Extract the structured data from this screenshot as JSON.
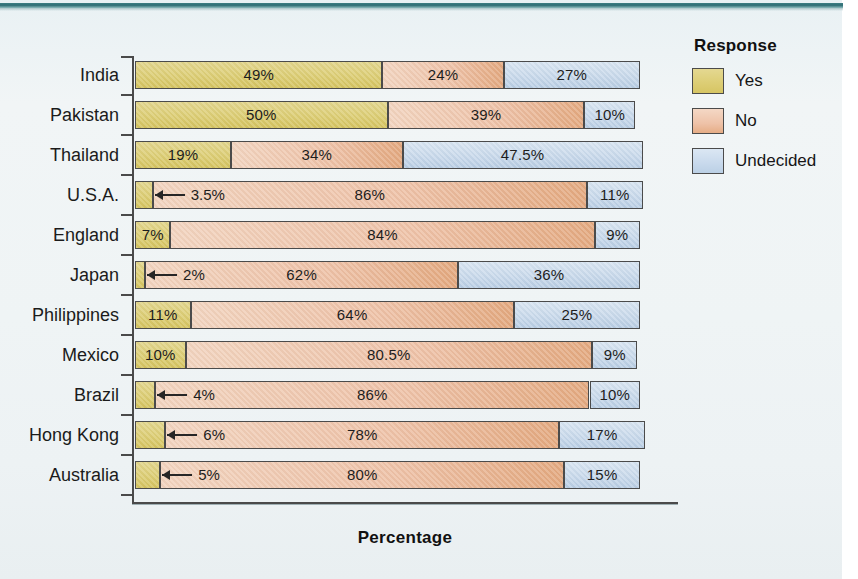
{
  "legend": {
    "title": "Response",
    "entries": [
      {
        "label": "Yes",
        "color": "#ddce76",
        "key": "yes"
      },
      {
        "label": "No",
        "color": "#eec2a8",
        "key": "no"
      },
      {
        "label": "Undecided",
        "color": "#c8d9ec",
        "key": "undecided"
      }
    ]
  },
  "axis": {
    "x_title": "Percentage"
  },
  "chart_data": {
    "type": "bar",
    "orientation": "horizontal",
    "stacked": true,
    "title": "",
    "xlabel": "Percentage",
    "ylabel": "",
    "xlim": [
      0,
      100
    ],
    "grid": false,
    "legend_title": "Response",
    "legend_position": "right",
    "colors": {
      "Yes": "#ddce76",
      "No": "#eec2a8",
      "Undecided": "#c8d9ec"
    },
    "categories": [
      "India",
      "Pakistan",
      "Thailand",
      "U.S.A.",
      "England",
      "Japan",
      "Philippines",
      "Mexico",
      "Brazil",
      "Hong Kong",
      "Australia"
    ],
    "series": [
      {
        "name": "Yes",
        "values": [
          49,
          50,
          19,
          3.5,
          7,
          2,
          11,
          10,
          4,
          6,
          5
        ]
      },
      {
        "name": "No",
        "values": [
          24,
          39,
          34,
          86,
          84,
          62,
          64,
          80.5,
          86,
          78,
          80
        ]
      },
      {
        "name": "Undecided",
        "values": [
          27,
          10,
          47.5,
          11,
          9,
          36,
          25,
          9,
          10,
          17,
          15
        ]
      }
    ],
    "labels": [
      {
        "category": "India",
        "yes": "49%",
        "no": "24%",
        "undecided": "27%"
      },
      {
        "category": "Pakistan",
        "yes": "50%",
        "no": "39%",
        "undecided": "10%"
      },
      {
        "category": "Thailand",
        "yes": "19%",
        "no": "34%",
        "undecided": "47.5%"
      },
      {
        "category": "U.S.A.",
        "yes": "3.5%",
        "no": "86%",
        "undecided": "11%"
      },
      {
        "category": "England",
        "yes": "7%",
        "no": "84%",
        "undecided": "9%"
      },
      {
        "category": "Japan",
        "yes": "2%",
        "no": "62%",
        "undecided": "36%"
      },
      {
        "category": "Philippines",
        "yes": "11%",
        "no": "64%",
        "undecided": "25%"
      },
      {
        "category": "Mexico",
        "yes": "10%",
        "no": "80.5%",
        "undecided": "9%"
      },
      {
        "category": "Brazil",
        "yes": "4%",
        "no": "86%",
        "undecided": "10%"
      },
      {
        "category": "Hong Kong",
        "yes": "6%",
        "no": "78%",
        "undecided": "17%"
      },
      {
        "category": "Australia",
        "yes": "5%",
        "no": "80%",
        "undecided": "15%"
      }
    ]
  }
}
